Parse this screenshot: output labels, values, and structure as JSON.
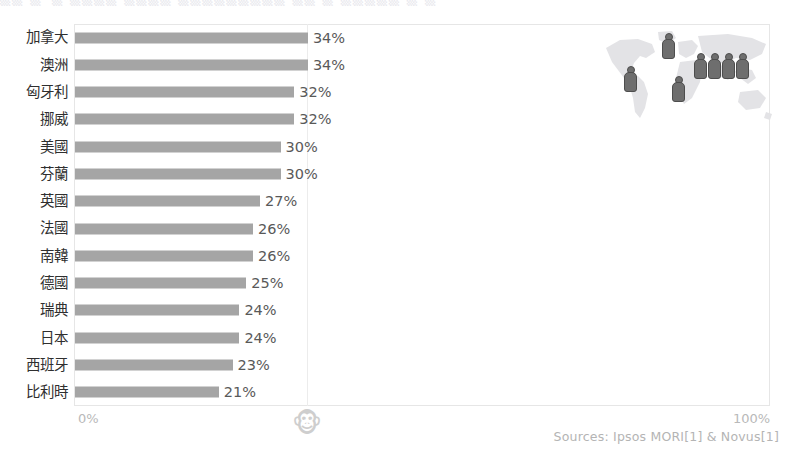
{
  "clipped_heading": "▒▒ ▒─▒ ▒▒▒▒  ▒▒▒▒   ▒▒▒▒▒▒▒▒▒ ▒▒  ▒  ▒▒▒▒▒   ▒  ▒",
  "chart_data": {
    "type": "bar",
    "orientation": "horizontal",
    "title": "",
    "xlabel": "",
    "ylabel": "",
    "xlim": [
      0,
      100
    ],
    "xticks": [
      "0%",
      "100%"
    ],
    "grid": true,
    "legend": "none",
    "bar_color": "#a5a5a5",
    "categories": [
      "加拿大",
      "澳洲",
      "匈牙利",
      "挪威",
      "美國",
      "芬蘭",
      "英國",
      "法國",
      "南韓",
      "德國",
      "瑞典",
      "日本",
      "西班牙",
      "比利時"
    ],
    "values": [
      34,
      34,
      32,
      32,
      30,
      30,
      27,
      26,
      26,
      25,
      24,
      24,
      23,
      21
    ],
    "value_labels": [
      "34%",
      "34%",
      "32%",
      "32%",
      "30%",
      "30%",
      "27%",
      "26%",
      "26%",
      "25%",
      "24%",
      "24%",
      "23%",
      "21%"
    ]
  },
  "axis": {
    "min_label": "0%",
    "max_label": "100%"
  },
  "footer": {
    "sources": "Sources: Ipsos MORI[1] & Novus[1]"
  },
  "watermark": {
    "monkey_glyph": "🐵"
  },
  "map_inset": {
    "name": "world-map-people-graphic",
    "pins": [
      {
        "label": "north-america",
        "left": 24,
        "top": 40
      },
      {
        "label": "europe-north",
        "left": 62,
        "top": 7
      },
      {
        "label": "africa",
        "left": 72,
        "top": 50
      },
      {
        "label": "asia-1",
        "left": 94,
        "top": 27
      },
      {
        "label": "asia-2",
        "left": 108,
        "top": 27
      },
      {
        "label": "asia-3",
        "left": 122,
        "top": 27
      },
      {
        "label": "asia-4",
        "left": 136,
        "top": 27
      }
    ]
  }
}
